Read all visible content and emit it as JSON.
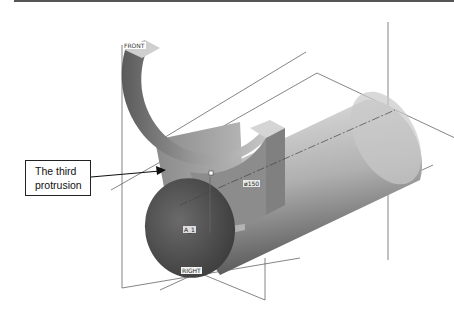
{
  "callout": {
    "line1": "The third",
    "line2": "protrusion"
  },
  "datum_labels": {
    "front": "FRONT",
    "right": "RIGHT",
    "axis": "A_1",
    "dimension": "ø150"
  },
  "colors": {
    "background": "#ffffff",
    "datum_lines": "#555555",
    "shade_dark": "#4a4a4a",
    "shade_light": "#d8d8d8"
  }
}
